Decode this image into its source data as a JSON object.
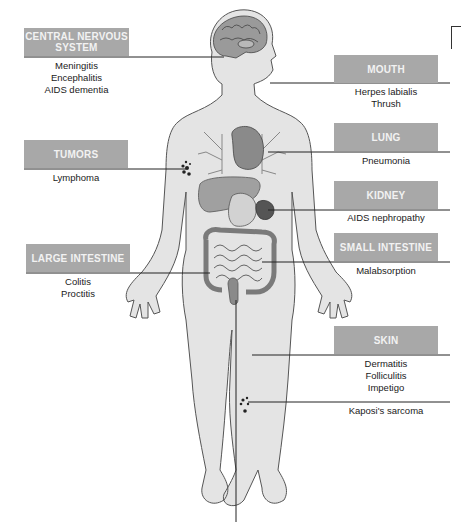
{
  "diagram": {
    "title": "",
    "colors": {
      "label_box": "#a8a8a8",
      "label_text": "#f2f2f2",
      "body_fill": "#e4e4e4",
      "body_outline": "#555555",
      "leader_line": "#222222"
    },
    "labels": [
      {
        "id": "cns",
        "heading": "CENTRAL NERVOUS SYSTEM",
        "heading_lines": [
          "CENTRAL NERVOUS",
          "SYSTEM"
        ],
        "conditions": [
          "Meningitis",
          "Encephalitis",
          "AIDS dementia"
        ]
      },
      {
        "id": "mouth",
        "heading": "MOUTH",
        "conditions": [
          "Herpes labialis",
          "Thrush"
        ]
      },
      {
        "id": "lung",
        "heading": "LUNG",
        "conditions": [
          "Pneumonia"
        ]
      },
      {
        "id": "tumors",
        "heading": "TUMORS",
        "conditions": [
          "Lymphoma"
        ]
      },
      {
        "id": "kidney",
        "heading": "KIDNEY",
        "conditions": [
          "AIDS nephropathy"
        ]
      },
      {
        "id": "small-intestine",
        "heading": "SMALL INTESTINE",
        "conditions": [
          "Malabsorption"
        ]
      },
      {
        "id": "large-intestine",
        "heading": "LARGE INTESTINE",
        "conditions": [
          "Colitis",
          "Proctitis"
        ]
      },
      {
        "id": "skin",
        "heading": "SKIN",
        "conditions": [
          "Dermatitis",
          "Folliculitis",
          "Impetigo",
          "Kaposi's sarcoma"
        ]
      }
    ]
  }
}
